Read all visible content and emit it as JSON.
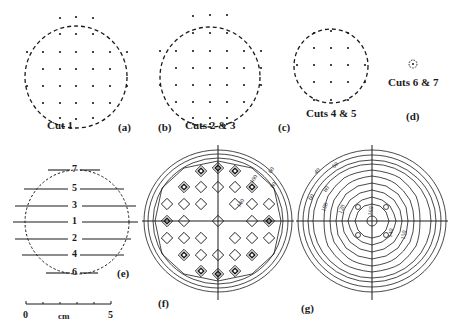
{
  "panels": {
    "a": {
      "tag": "(a)",
      "caption": "Cut 1"
    },
    "b": {
      "tag": "(b)",
      "caption": "Cuts 2 & 3"
    },
    "c": {
      "tag": "(c)",
      "caption": "Cuts 4 & 5"
    },
    "d": {
      "tag": "(d)",
      "caption": "Cuts 6 & 7"
    },
    "e": {
      "tag": "(e)",
      "cut_lines": [
        "7",
        "5",
        "3",
        "1",
        "2",
        "4",
        "6"
      ]
    },
    "f": {
      "tag": "(f)",
      "contour_labels": [
        "60",
        "80",
        "60",
        "80",
        "100",
        "120",
        "140"
      ]
    },
    "g": {
      "tag": "(g)",
      "contour_labels": [
        "40",
        "60",
        "60",
        "80",
        "100",
        "120",
        "140",
        "160",
        "140",
        "150"
      ]
    }
  },
  "scale_bar": {
    "start": "0",
    "unit": "cm",
    "end": "5"
  },
  "colors": {
    "ink": "#1a1a1a",
    "background": "#ffffff"
  }
}
